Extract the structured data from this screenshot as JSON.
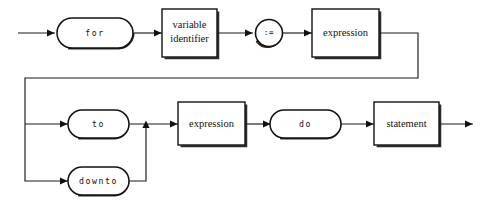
{
  "diagram": {
    "kind": "railroad-syntax-diagram",
    "stroke_color": "#111111",
    "background_color": "#ffffff",
    "nodes": {
      "for_keyword": {
        "label": "for",
        "shape": "terminal-pill"
      },
      "variable_identifier": {
        "label_line1": "variable",
        "label_line2": "identifier",
        "shape": "nonterminal-box"
      },
      "assign_operator": {
        "label": ":=",
        "shape": "operator-circle"
      },
      "expression_initial": {
        "label": "expression",
        "shape": "nonterminal-box"
      },
      "to_keyword": {
        "label": "to",
        "shape": "terminal-pill"
      },
      "downto_keyword": {
        "label": "downto",
        "shape": "terminal-pill"
      },
      "expression_final": {
        "label": "expression",
        "shape": "nonterminal-box"
      },
      "do_keyword": {
        "label": "do",
        "shape": "terminal-pill"
      },
      "statement": {
        "label": "statement",
        "shape": "nonterminal-box"
      }
    }
  }
}
